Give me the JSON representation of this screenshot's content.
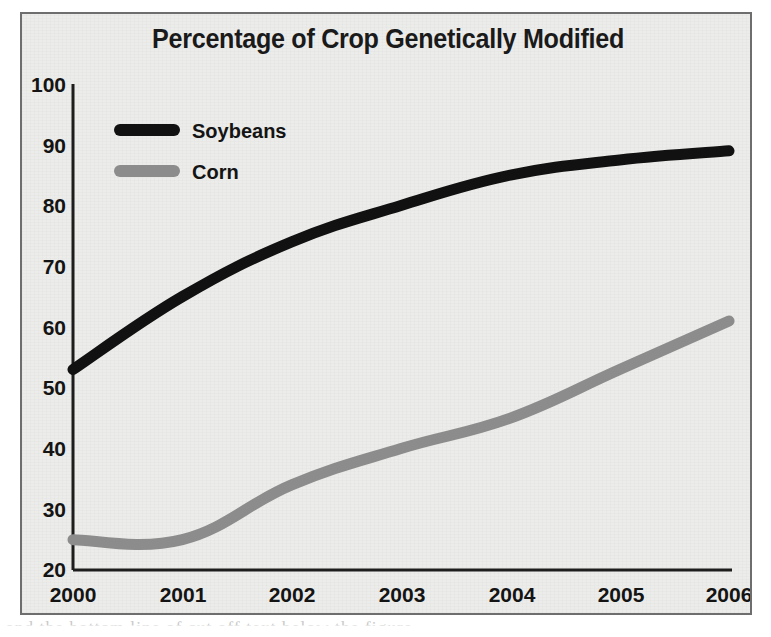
{
  "figure": {
    "title": "Percentage of Crop Genetically Modified",
    "frame_color": "#6e6e6e",
    "background_color": "#ececea"
  },
  "legend": {
    "position": "top-left-inside",
    "entries": [
      {
        "label": "Soybeans",
        "color": "#111111"
      },
      {
        "label": "Corn",
        "color": "#8c8c8c"
      }
    ]
  },
  "axes": {
    "y_ticks": [
      "100",
      "90",
      "80",
      "70",
      "60",
      "50",
      "40",
      "30",
      "20"
    ],
    "x_ticks": [
      "2000",
      "2001",
      "2002",
      "2003",
      "2004",
      "2005",
      "2006"
    ],
    "axis_color": "#1d1d1d"
  },
  "page_artifact": {
    "text": "and the bottom line of cut off text below the figure"
  },
  "chart_data": {
    "type": "line",
    "title": "Percentage of Crop Genetically Modified",
    "xlabel": "",
    "ylabel": "",
    "categories": [
      "2000",
      "2001",
      "2002",
      "2003",
      "2004",
      "2005",
      "2006"
    ],
    "x": [
      2000,
      2001,
      2002,
      2003,
      2004,
      2005,
      2006
    ],
    "ylim": [
      20,
      100
    ],
    "xlim": [
      2000,
      2006
    ],
    "ytick_step": 10,
    "grid": false,
    "legend_position": "upper left",
    "series": [
      {
        "name": "Soybeans",
        "color": "#111111",
        "values": [
          53,
          65,
          74,
          80,
          85,
          87.5,
          89
        ]
      },
      {
        "name": "Corn",
        "color": "#8c8c8c",
        "values": [
          25,
          25,
          34,
          40,
          45,
          53,
          61
        ]
      }
    ]
  }
}
